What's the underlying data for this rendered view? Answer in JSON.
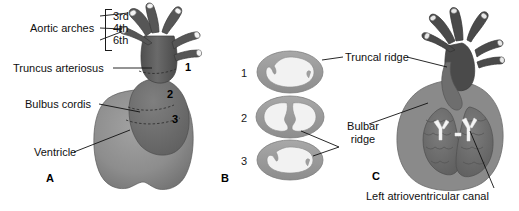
{
  "figure": {
    "background_color": "#ffffff"
  },
  "panels": [
    {
      "id": "A",
      "letter": "A"
    },
    {
      "id": "B",
      "letter": "B"
    },
    {
      "id": "C",
      "letter": "C"
    }
  ],
  "panel_a": {
    "group_label": "Aortic arches",
    "arch_labels": [
      {
        "text": "3rd"
      },
      {
        "text": "4th"
      },
      {
        "text": "6th"
      }
    ],
    "labels": [
      {
        "text": "Truncus arteriosus"
      },
      {
        "text": "Bulbus cordis"
      },
      {
        "text": "Ventricle"
      }
    ],
    "section_markers": [
      {
        "text": "1"
      },
      {
        "text": "2"
      },
      {
        "text": "3"
      }
    ]
  },
  "panel_b": {
    "section_numbers": [
      {
        "text": "1"
      },
      {
        "text": "2"
      },
      {
        "text": "3"
      }
    ],
    "labels": [
      {
        "text": "Truncal ridge"
      },
      {
        "line1": "Bulbar",
        "line2": "ridge"
      }
    ]
  },
  "panel_c": {
    "labels": [
      {
        "text": "Left atrioventricular canal"
      }
    ]
  },
  "colors": {
    "outline": "#1a1a1a",
    "leader_line": "#111111",
    "truncus_dark": "#5d5d5d",
    "arch_dark": "#555555",
    "bulbus_mid": "#7a7a7a",
    "ventricle_light": "#8e8e8e",
    "ventricle_shade": "#9a9a9a",
    "ring_wall": "#9d9d9d",
    "ring_lumen": "#f2f2f2",
    "panel_c_wall": "#8a8a8a",
    "panel_c_chamber": "#6f6f6f",
    "av_canal_white": "#f5f5f5",
    "text": "#101010"
  }
}
